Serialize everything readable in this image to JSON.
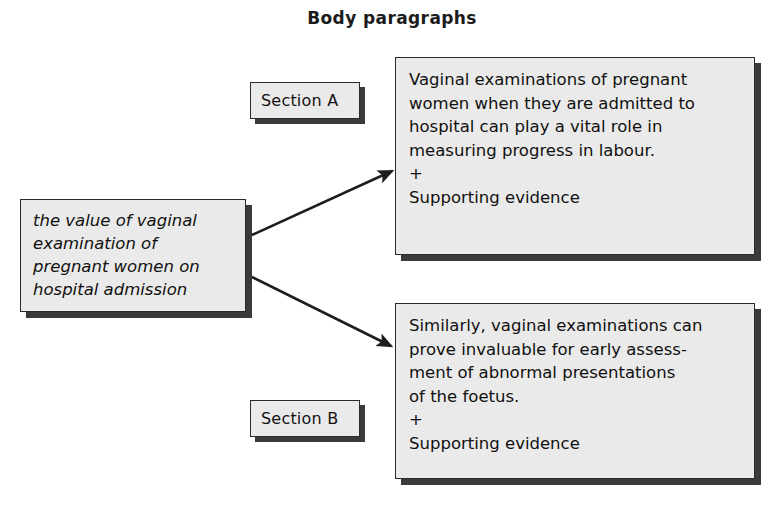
{
  "title": "Body paragraphs",
  "stem": {
    "text": "the value of vaginal\nexamination of\npregnant women on\nhospital admission"
  },
  "sections": [
    {
      "label": "Section A",
      "paragraph": "Vaginal examinations of pregnant\nwomen when they are admitted to\nhospital can play a vital role in\nmeasuring progress in labour.\n+\nSupporting evidence"
    },
    {
      "label": "Section B",
      "paragraph": "Similarly, vaginal examinations can\nprove invaluable for early assess-\nment of abnormal presentations\nof the foetus.\n+\nSupporting evidence"
    }
  ],
  "arrows": [
    {
      "name": "arrow-to-section-a",
      "from_x": 252,
      "from_y": 235,
      "to_x": 392,
      "to_y": 171
    },
    {
      "name": "arrow-to-section-b",
      "from_x": 252,
      "from_y": 277,
      "to_x": 391,
      "to_y": 346
    }
  ],
  "colors": {
    "box_fill": "#ebeaea",
    "box_border": "#2b2b2b",
    "box_shadow": "#3a3a3a",
    "text": "#101010",
    "background": "#ffffff",
    "arrow": "#1d1d1d"
  }
}
